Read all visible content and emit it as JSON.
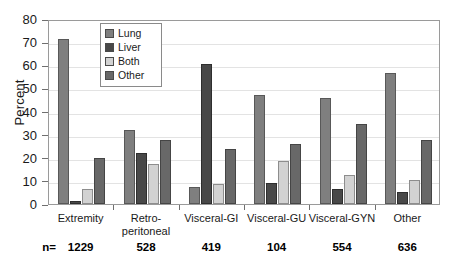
{
  "chart_data": {
    "type": "bar",
    "title": "",
    "xlabel": "",
    "ylabel": "Percent",
    "ylim": [
      0,
      80
    ],
    "yticks": [
      0,
      10,
      20,
      30,
      40,
      50,
      60,
      70,
      80
    ],
    "grid": true,
    "legend_position": "inside-top-left",
    "categories": [
      "Extremity",
      "Retro-\nperitoneal",
      "Visceral-GI",
      "Visceral-GU",
      "Visceral-GYN",
      "Other"
    ],
    "category_labels": [
      [
        "Extremity"
      ],
      [
        "Retro-",
        "peritoneal"
      ],
      [
        "Visceral-GI"
      ],
      [
        "Visceral-GU"
      ],
      [
        "Visceral-GYN"
      ],
      [
        "Other"
      ]
    ],
    "series": [
      {
        "name": "Lung",
        "color": "#7f7f7f",
        "values": [
          71.5,
          32.0,
          7.5,
          47.0,
          46.0,
          56.5
        ]
      },
      {
        "name": "Liver",
        "color": "#484848",
        "values": [
          1.5,
          22.0,
          60.5,
          9.0,
          6.5,
          5.0
        ]
      },
      {
        "name": "Both",
        "color": "#d2d2d2",
        "values": [
          6.5,
          17.5,
          8.5,
          18.5,
          12.5,
          10.5
        ]
      },
      {
        "name": "Other",
        "color": "#686868",
        "values": [
          20.0,
          27.5,
          24.0,
          26.0,
          34.5,
          27.5
        ]
      }
    ],
    "n_prefix": "n=",
    "n_values": [
      "1229",
      "528",
      "419",
      "104",
      "554",
      "636"
    ]
  }
}
